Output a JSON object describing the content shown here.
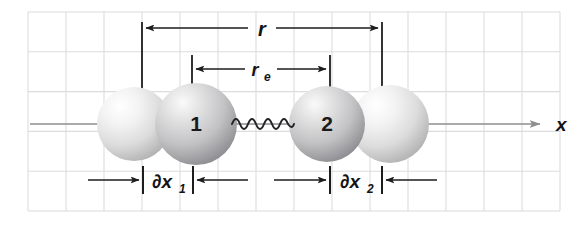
{
  "figure": {
    "width": 588,
    "height": 228,
    "background_color": "#ffffff",
    "grid_color": "#dcdcde",
    "ink_color": "#1d1d1f",
    "axis_color": "#8e8e90"
  },
  "axis": {
    "name": "x-axis",
    "label": "x",
    "arrow_direction": "right",
    "y": 124,
    "x_start": 30,
    "x_end": 540,
    "label_x": 556,
    "label_y": 131
  },
  "atoms": [
    {
      "id": "equilibrium-sphere-left",
      "label": "",
      "role": "equilibrium position of atom 1",
      "cx": 134,
      "cy": 124,
      "r": 37,
      "shade": "light",
      "fill_light": "#fbfbfb",
      "fill_mid": "#e2e2e2",
      "fill_dark": "#b9b9ba"
    },
    {
      "id": "atom-1",
      "label": "1",
      "role": "displaced atom 1",
      "cx": 196,
      "cy": 124,
      "r": 41,
      "shade": "dark",
      "fill_light": "#f2f2f2",
      "fill_mid": "#c9c9ca",
      "fill_dark": "#97979a"
    },
    {
      "id": "atom-2",
      "label": "2",
      "role": "displaced atom 2",
      "cx": 327,
      "cy": 124,
      "r": 38,
      "shade": "dark",
      "fill_light": "#f1f1f1",
      "fill_mid": "#c6c6c8",
      "fill_dark": "#949497"
    },
    {
      "id": "equilibrium-sphere-right",
      "label": "",
      "role": "equilibrium position of atom 2",
      "cx": 390,
      "cy": 124,
      "r": 39,
      "shade": "light",
      "fill_light": "#fcfcfc",
      "fill_mid": "#e4e4e4",
      "fill_dark": "#bcbcbd"
    }
  ],
  "bond": {
    "name": "spring-bond",
    "description": "coil spring connecting atom 1 and atom 2",
    "x_start": 232,
    "x_end": 292,
    "y": 124,
    "cycles": 5.5,
    "amplitude": 7
  },
  "dimensions": [
    {
      "id": "dimension-r",
      "label": "r",
      "subscript": "",
      "description": "instantaneous internuclear separation",
      "y": 28,
      "x_left": 142,
      "x_right": 382,
      "label_x": 262,
      "label_y": 35,
      "ext_left_x": 142,
      "ext_left_y1": 22,
      "ext_left_y2": 100,
      "ext_right_x": 382,
      "ext_right_y1": 22,
      "ext_right_y2": 100,
      "arrow_style": "outward-pointing"
    },
    {
      "id": "dimension-re",
      "label": "r",
      "subscript": "e",
      "description": "equilibrium internuclear separation",
      "y": 69,
      "x_left": 192,
      "x_right": 330,
      "label_x": 261,
      "label_y": 76,
      "ext_left_x": 192,
      "ext_left_y1": 55,
      "ext_left_y2": 96,
      "ext_right_x": 330,
      "ext_right_y1": 55,
      "ext_right_y2": 96,
      "arrow_style": "outward-pointing"
    },
    {
      "id": "dimension-dx1",
      "label": "∂x",
      "subscript": "1",
      "description": "displacement of atom 1 from equilibrium",
      "y": 180,
      "tick_left_x": 143,
      "tick_right_x": 193,
      "tick_y1": 166,
      "tick_y2": 194,
      "arrow_outer_left_x": 88,
      "arrow_outer_right_x": 248,
      "label_x": 168,
      "label_y": 188,
      "arrow_style": "inward-pointing"
    },
    {
      "id": "dimension-dx2",
      "label": "∂x",
      "subscript": "2",
      "description": "displacement of atom 2 from equilibrium",
      "y": 180,
      "tick_left_x": 330,
      "tick_right_x": 382,
      "tick_y1": 166,
      "tick_y2": 194,
      "arrow_outer_left_x": 274,
      "arrow_outer_right_x": 437,
      "label_x": 356,
      "label_y": 188,
      "arrow_style": "inward-pointing"
    }
  ],
  "grid": {
    "x_start": 28,
    "x_end": 560,
    "y_start": 12,
    "y_end": 211,
    "cell_width": 38.0,
    "cell_height": 39.8,
    "columns": 14,
    "rows": 5
  }
}
